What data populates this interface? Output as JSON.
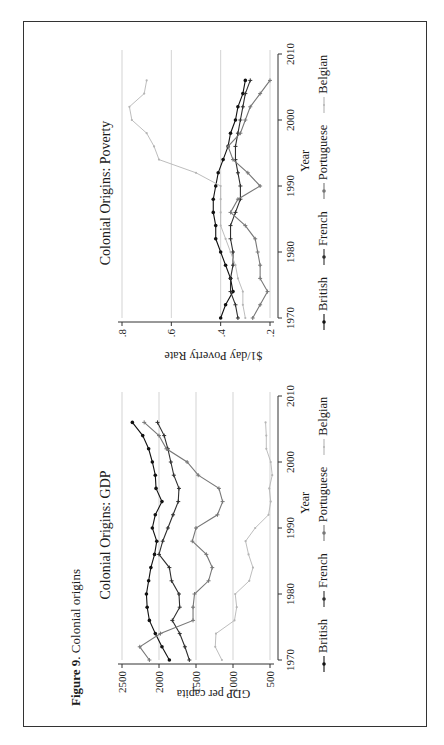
{
  "figure": {
    "caption_label": "Figure 9",
    "caption_text": ". Colonial origins"
  },
  "colors": {
    "British": "#111111",
    "French": "#2e2e2e",
    "Portuguese": "#777777",
    "Belgian": "#b5b5b5",
    "grid": "#c8c8c8",
    "frame": "#333333"
  },
  "legend": [
    "British",
    "French",
    "Portuguese",
    "Belgian"
  ],
  "chart_data": [
    {
      "type": "line",
      "title": "Colonial Origins: GDP",
      "xlabel": "Year",
      "ylabel": "GDP per capita",
      "xlim": [
        1970,
        2010
      ],
      "ylim": [
        500,
        2500
      ],
      "xticks": [
        1970,
        1980,
        1990,
        2000,
        2010
      ],
      "yticks": [
        500,
        1000,
        1500,
        2000,
        2500
      ],
      "grid": true,
      "legend_position": "bottom",
      "x": [
        1970,
        1972,
        1974,
        1976,
        1978,
        1980,
        1982,
        1984,
        1986,
        1988,
        1990,
        1992,
        1994,
        1996,
        1998,
        2000,
        2002,
        2004,
        2006
      ],
      "series": [
        {
          "name": "British",
          "values": [
            1860,
            1960,
            2050,
            2130,
            2160,
            2170,
            2140,
            2110,
            2060,
            2030,
            2090,
            2050,
            1960,
            2040,
            2050,
            2090,
            2140,
            2220,
            2360
          ]
        },
        {
          "name": "French",
          "values": [
            1590,
            1650,
            1720,
            1820,
            1720,
            1730,
            1830,
            1860,
            2000,
            1950,
            1880,
            1810,
            1740,
            1730,
            1800,
            1840,
            1880,
            1930,
            2020
          ]
        },
        {
          "name": "Portuguese",
          "values": [
            2130,
            2260,
            1980,
            1540,
            1540,
            1520,
            1330,
            1280,
            1360,
            1550,
            1500,
            1210,
            1140,
            1190,
            1470,
            1620,
            1900,
            2000,
            2200
          ]
        },
        {
          "name": "Belgian",
          "values": [
            1150,
            1240,
            1230,
            980,
            950,
            970,
            780,
            730,
            790,
            830,
            700,
            520,
            490,
            510,
            470,
            490,
            550,
            550,
            560
          ]
        }
      ]
    },
    {
      "type": "line",
      "title": "Colonial Origins: Poverty",
      "xlabel": "Year",
      "ylabel": "$1/day Poverty Rate",
      "xlim": [
        1970,
        2010
      ],
      "ylim": [
        0.2,
        0.8
      ],
      "xticks": [
        1970,
        1980,
        1990,
        2000,
        2010
      ],
      "yticks": [
        0.2,
        0.4,
        0.6,
        0.8
      ],
      "ytick_labels": [
        ".2",
        ".4",
        ".6",
        ".8"
      ],
      "grid": true,
      "legend_position": "bottom",
      "x": [
        1970,
        1972,
        1974,
        1976,
        1978,
        1980,
        1982,
        1984,
        1986,
        1988,
        1990,
        1992,
        1994,
        1996,
        1998,
        2000,
        2002,
        2004,
        2006
      ],
      "series": [
        {
          "name": "British",
          "values": [
            0.4,
            0.38,
            0.35,
            0.36,
            0.38,
            0.4,
            0.42,
            0.42,
            0.43,
            0.43,
            0.42,
            0.41,
            0.39,
            0.37,
            0.36,
            0.34,
            0.33,
            0.31,
            0.3
          ]
        },
        {
          "name": "French",
          "values": [
            0.33,
            0.34,
            0.36,
            0.36,
            0.35,
            0.35,
            0.36,
            0.36,
            0.34,
            0.32,
            0.32,
            0.33,
            0.34,
            0.34,
            0.33,
            0.32,
            0.31,
            0.3,
            0.28
          ]
        },
        {
          "name": "Portuguese",
          "values": [
            0.27,
            0.24,
            0.21,
            0.24,
            0.24,
            0.25,
            0.26,
            0.3,
            0.36,
            0.33,
            0.24,
            0.29,
            0.35,
            0.37,
            0.32,
            0.3,
            0.28,
            0.24,
            0.2
          ]
        },
        {
          "name": "Belgian",
          "values": [
            0.3,
            0.31,
            0.31,
            0.33,
            0.34,
            0.36,
            0.38,
            0.4,
            0.4,
            0.4,
            0.4,
            0.5,
            0.65,
            0.67,
            0.7,
            0.76,
            0.77,
            0.71,
            0.7
          ]
        }
      ]
    }
  ]
}
